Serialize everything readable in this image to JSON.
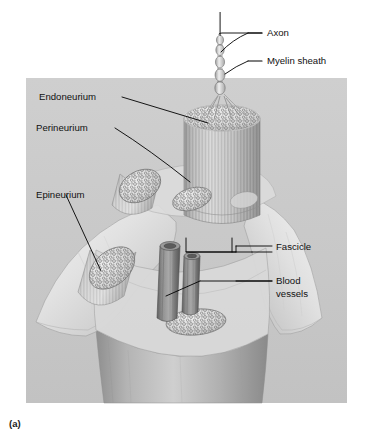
{
  "figure": {
    "caption": "(a)",
    "page_header": "",
    "panel_color": "#c9c9c9",
    "background_color": "#ffffff",
    "label_color": "#111111",
    "leader_color": "#000000"
  },
  "labels": {
    "axon": "Axon",
    "myelin_sheath": "Myelin sheath",
    "endoneurium": "Endoneurium",
    "perineurium": "Perineurium",
    "epineurium": "Epineurium",
    "fascicle": "Fascicle",
    "blood_vessels_line1": "Blood",
    "blood_vessels_line2": "vessels"
  },
  "structures": {
    "axon": "axon-fiber",
    "myelin_sheath": "myelin-sheath-segments",
    "central_fascicle": "central-fascicle-cylinder",
    "fascicles": [
      "fascicle-upper-left",
      "fascicle-mid-left",
      "fascicle-lower-left",
      "fascicle-lower-center",
      "fascicle-right"
    ],
    "blood_vessels": [
      "blood-vessel-large",
      "blood-vessel-small"
    ],
    "epineurium_sheet": "epineurium-membrane",
    "nerve_trunk": "nerve-trunk-body"
  }
}
